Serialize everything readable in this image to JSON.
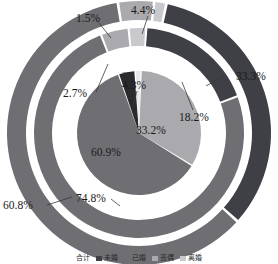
{
  "chart_data": {
    "type": "pie",
    "title": "",
    "subtitle": "",
    "xlabel": "",
    "ylabel": "",
    "legend_position": "bottom",
    "grid": false,
    "categories": [
      "合计",
      "未婚",
      "已婚",
      "丧偶",
      "离婚"
    ],
    "rings": [
      {
        "name": "outer-ring",
        "values": [
          33.3,
          60.8,
          4.4,
          1.5
        ],
        "labels": [
          "33.3%",
          "60.8%",
          "4.4%",
          "1.5%"
        ]
      },
      {
        "name": "middle-ring",
        "values": [
          18.2,
          74.8,
          4.3,
          2.7
        ],
        "labels": [
          "18.2%",
          "74.8%",
          "4.3%",
          "2.7%"
        ]
      },
      {
        "name": "inner-pie",
        "values": [
          33.2,
          60.9,
          4.3,
          1.6
        ],
        "labels": [
          "33.2%",
          "60.9%",
          "",
          ""
        ]
      }
    ],
    "annotations": [
      {
        "id": "outer-33",
        "text": "33.3%",
        "x": 236,
        "y": 77
      },
      {
        "id": "outer-61",
        "text": "60.8%",
        "x": 24,
        "y": 209
      },
      {
        "id": "outer-44",
        "text": "4.4%",
        "x": 145,
        "y": 11
      },
      {
        "id": "outer-15",
        "text": "1.5%",
        "x": 92,
        "y": 18
      },
      {
        "id": "mid-18",
        "text": "18.2%",
        "x": 196,
        "y": 116
      },
      {
        "id": "mid-75",
        "text": "74.8%",
        "x": 96,
        "y": 196
      },
      {
        "id": "mid-43",
        "text": "4.3%",
        "x": 136,
        "y": 85
      },
      {
        "id": "mid-27",
        "text": "2.7%",
        "x": 83,
        "y": 98
      },
      {
        "id": "in-33",
        "text": "33.2%",
        "x": 150,
        "y": 130
      },
      {
        "id": "in-61",
        "text": "60.9%",
        "x": 107,
        "y": 152
      }
    ]
  },
  "colors": {
    "dark": "#3f3f46",
    "mid": "#6e6e73",
    "light": "#a9a9ae",
    "pale": "#c9c9cd",
    "near_black": "#2a2a2e",
    "white": "#ffffff",
    "text": "#1a1a1a"
  },
  "legend": {
    "items": [
      {
        "label": "合计",
        "swatch": "#ffffff",
        "has_swatch": false
      },
      {
        "label": "未婚",
        "swatch": "#3f3f46",
        "has_swatch": true
      },
      {
        "label": "已婚",
        "swatch": "#6e6e73",
        "has_swatch": true
      },
      {
        "label": "丧偶",
        "swatch": "#a9a9ae",
        "has_swatch": true
      },
      {
        "label": "离婚",
        "swatch": "#c9c9cd",
        "has_swatch": true
      }
    ]
  },
  "labels": {
    "outer_33": "33.3%",
    "outer_61": "60.8%",
    "outer_44": "4.4%",
    "outer_15": "1.5%",
    "mid_18": "18.2%",
    "mid_75": "74.8%",
    "mid_43": "4.3%",
    "mid_27": "2.7%",
    "inner_33": "33.2%",
    "inner_61": "60.9%"
  }
}
